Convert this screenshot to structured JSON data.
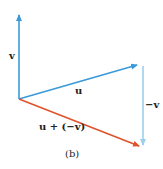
{
  "figure": {
    "caption": "(b)",
    "colors": {
      "blue": "#3a9ad9",
      "light_blue": "#9fcdee",
      "red": "#e0522a",
      "text": "#231f20"
    },
    "vectors": [
      {
        "id": "v",
        "label": "v",
        "from": [
          19,
          99
        ],
        "to": [
          19,
          13
        ],
        "color": "blue"
      },
      {
        "id": "u",
        "label": "u",
        "from": [
          19,
          99
        ],
        "to": [
          139,
          64
        ],
        "color": "blue"
      },
      {
        "id": "neg_v",
        "label": "−v",
        "from": [
          143,
          65
        ],
        "to": [
          143,
          147
        ],
        "color": "light_blue"
      },
      {
        "id": "u_plus_neg_v",
        "label": "u + (−v)",
        "from": [
          19,
          99
        ],
        "to": [
          141,
          147
        ],
        "color": "red"
      }
    ]
  }
}
